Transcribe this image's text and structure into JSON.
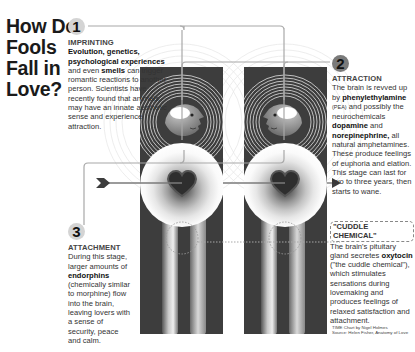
{
  "title": [
    "How Do",
    "Fools",
    "Fall in",
    "Love?"
  ],
  "stages": [
    {
      "number": "1",
      "heading": "IMPRINTING",
      "bold_lead": [
        "Evolution, genetics,",
        "psychological experiences"
      ],
      "text_1": "and even ",
      "bold_1": "smells",
      "text_2": " can trigger romantic reactions to another person. Scientists have recently found that animals may have an innate aesthetic sense and experience attraction."
    },
    {
      "number": "2",
      "heading": "ATTRACTION",
      "text_1": "The brain is revved up by ",
      "bold_1": "phenylethylamine",
      "small_1": "(PEA)",
      "text_2": " and possibly the neurochemicals ",
      "bold_2": "dopamine",
      "text_3": " and ",
      "bold_3": "norepinephrine,",
      "text_4": " all natural amphetamines. These produce feelings of euphoria and elation. This stage can last for two to three years, then starts to wane."
    },
    {
      "number": "3",
      "heading": "ATTACHMENT",
      "text_1": "During this stage, larger amounts of ",
      "bold_1": "endorphins",
      "text_2": " (chemically similar to morphine) flow into the brain, leaving lovers with a sense of security, peace and calm."
    },
    {
      "heading": "\"CUDDLE CHEMICAL\"",
      "text_1": "The brain's pituitary gland secretes ",
      "bold_1": "oxytocin",
      "text_2": " (\"the cuddle chemical\"), which stimulates sensations during lovemaking and produces feelings of relaxed satisfaction and attachment."
    }
  ],
  "credits": {
    "line1": "TIME Chart by Nigel Holmes",
    "line2": "Source: Helen Fisher, Anatomy of Love"
  },
  "colors": {
    "panel": "#3d3d3d",
    "connector": "#9a9a9a",
    "heart": "#2e2e2e",
    "badge": "#d4d4d4"
  }
}
